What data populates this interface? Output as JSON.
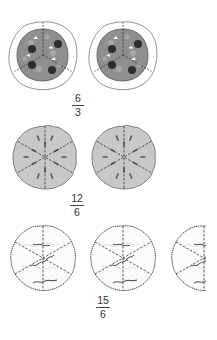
{
  "rows": [
    {
      "model": "pizza",
      "items_count": 2,
      "slices_per_item": 3,
      "fraction": {
        "numerator": "6",
        "denominator": "3"
      }
    },
    {
      "model": "pie",
      "items_count": 2,
      "slices_per_item": 6,
      "fraction": {
        "numerator": "12",
        "denominator": "6"
      }
    },
    {
      "model": "pie",
      "items_count": 3,
      "slices_per_item": 6,
      "fraction": {
        "numerator": "15",
        "denominator": "6"
      }
    }
  ],
  "colors": {
    "pizza_sauce": "#8f8f8f",
    "pizza_crust": "#ffffff",
    "pepperoni": "#2e2e2e",
    "pie_fill": "#c8c8c8",
    "outline": "#555555"
  }
}
